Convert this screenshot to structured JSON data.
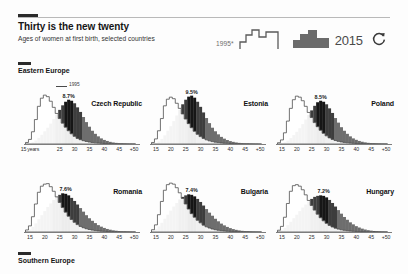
{
  "header": {
    "kicker_mark": "dark-rule",
    "title": "Thirty is the new twenty",
    "subtitle": "Ages of women at first birth, selected countries"
  },
  "legend": {
    "old_year": "1995*",
    "old_icon": "histogram-outline-icon",
    "new_year": "2015",
    "new_icon": "histogram-filled-icon",
    "refresh_icon": "refresh-circular-arrow-icon"
  },
  "regions": {
    "east": "Eastern Europe",
    "south": "Southern Europe"
  },
  "inline_legend": {
    "label": "1995"
  },
  "axis": {
    "ticks": [
      "15 years",
      "25",
      "30",
      "35",
      "40",
      "45",
      "+50"
    ],
    "ticks_short": [
      "15",
      "20",
      "25",
      "30",
      "35",
      "40",
      "45",
      "+50"
    ],
    "tick_positions": [
      15,
      20,
      25,
      30,
      35,
      40,
      45,
      50
    ],
    "xmin": 13,
    "xmax": 52
  },
  "colors": {
    "ink": "#1c1c1c",
    "series_1995": "#ffffff",
    "series_1995_stroke": "#4f4f4f",
    "series_2015": "#6e6e6e",
    "series_2015_peak": "#161616",
    "background": "#fdfdfd"
  },
  "chart_data": {
    "type": "area",
    "title": "Thirty is the new twenty",
    "subtitle": "Ages of women at first birth, selected countries",
    "xlabel": "Age at first birth (years)",
    "ylabel": "Share of first births (%)",
    "xlim": [
      13,
      52
    ],
    "ylim": [
      0,
      11
    ],
    "grid": false,
    "legend": [
      "1995*",
      "2015"
    ],
    "legend_position": "top-right",
    "x": [
      14,
      15,
      16,
      17,
      18,
      19,
      20,
      21,
      22,
      23,
      24,
      25,
      26,
      27,
      28,
      29,
      30,
      31,
      32,
      33,
      34,
      35,
      36,
      37,
      38,
      39,
      40,
      41,
      42,
      43,
      44,
      45,
      46,
      47,
      48,
      49,
      50
    ],
    "panels": [
      {
        "country": "Czech Republic",
        "region": "Eastern Europe",
        "peak_label": "8.7%",
        "peak_age": 28,
        "series": [
          {
            "name": "1995*",
            "peak": 9.6,
            "peak_age": 20,
            "values": [
              0.3,
              0.9,
              2.4,
              4.8,
              7.4,
              9.0,
              9.6,
              9.3,
              8.4,
              7.2,
              6.0,
              5.0,
              4.1,
              3.3,
              2.6,
              2.0,
              1.5,
              1.1,
              0.85,
              0.65,
              0.5,
              0.38,
              0.3,
              0.23,
              0.18,
              0.14,
              0.11,
              0.08,
              0.06,
              0.05,
              0.04,
              0.03,
              0.02,
              0.02,
              0.01,
              0.01,
              0.01
            ]
          },
          {
            "name": "2015",
            "peak": 8.7,
            "peak_age": 28,
            "values": [
              0.05,
              0.15,
              0.35,
              0.7,
              1.2,
              1.8,
              2.5,
              3.2,
              4.0,
              4.9,
              5.8,
              6.7,
              7.6,
              8.3,
              8.7,
              8.5,
              8.0,
              7.2,
              6.3,
              5.3,
              4.3,
              3.4,
              2.6,
              2.0,
              1.5,
              1.1,
              0.8,
              0.6,
              0.42,
              0.3,
              0.22,
              0.16,
              0.11,
              0.08,
              0.05,
              0.04,
              0.03
            ]
          }
        ]
      },
      {
        "country": "Estonia",
        "region": "Eastern Europe",
        "peak_label": "9.5%",
        "peak_age": 27,
        "series": [
          {
            "name": "1995*",
            "peak": 9.2,
            "peak_age": 20,
            "values": [
              0.3,
              1.0,
              2.6,
              5.0,
              7.5,
              8.8,
              9.2,
              8.9,
              8.0,
              7.0,
              5.9,
              4.9,
              4.0,
              3.2,
              2.5,
              1.9,
              1.45,
              1.1,
              0.82,
              0.62,
              0.47,
              0.36,
              0.28,
              0.21,
              0.16,
              0.13,
              0.1,
              0.08,
              0.06,
              0.045,
              0.035,
              0.027,
              0.02,
              0.015,
              0.012,
              0.01,
              0.008
            ]
          },
          {
            "name": "2015",
            "peak": 9.5,
            "peak_age": 27,
            "values": [
              0.06,
              0.2,
              0.5,
              1.0,
              1.7,
              2.6,
              3.5,
              4.5,
              5.6,
              6.7,
              7.8,
              8.7,
              9.3,
              9.5,
              9.1,
              8.3,
              7.3,
              6.2,
              5.1,
              4.1,
              3.2,
              2.5,
              1.9,
              1.4,
              1.05,
              0.78,
              0.57,
              0.42,
              0.3,
              0.22,
              0.16,
              0.12,
              0.09,
              0.06,
              0.045,
              0.03,
              0.025
            ]
          }
        ]
      },
      {
        "country": "Poland",
        "region": "Eastern Europe",
        "peak_label": "8.5%",
        "peak_age": 28,
        "series": [
          {
            "name": "1995*",
            "peak": 9.4,
            "peak_age": 21,
            "values": [
              0.25,
              0.8,
              2.2,
              4.5,
              7.0,
              8.7,
              9.4,
              9.2,
              8.5,
              7.4,
              6.2,
              5.2,
              4.2,
              3.4,
              2.7,
              2.1,
              1.6,
              1.2,
              0.9,
              0.68,
              0.52,
              0.4,
              0.31,
              0.24,
              0.18,
              0.14,
              0.11,
              0.085,
              0.065,
              0.05,
              0.04,
              0.03,
              0.022,
              0.017,
              0.013,
              0.01,
              0.008
            ]
          },
          {
            "name": "2015",
            "peak": 8.5,
            "peak_age": 28,
            "values": [
              0.05,
              0.14,
              0.33,
              0.66,
              1.15,
              1.75,
              2.4,
              3.1,
              3.9,
              4.8,
              5.7,
              6.6,
              7.5,
              8.2,
              8.5,
              8.3,
              7.8,
              7.0,
              6.1,
              5.1,
              4.2,
              3.3,
              2.6,
              2.0,
              1.5,
              1.1,
              0.82,
              0.6,
              0.44,
              0.32,
              0.23,
              0.17,
              0.12,
              0.085,
              0.06,
              0.045,
              0.035
            ]
          }
        ]
      },
      {
        "country": "Romania",
        "region": "Eastern Europe",
        "peak_label": "7.6%",
        "peak_age": 27,
        "series": [
          {
            "name": "1995*",
            "peak": 9.5,
            "peak_age": 21,
            "values": [
              0.4,
              1.2,
              3.0,
              5.5,
              7.8,
              9.0,
              9.4,
              9.5,
              8.9,
              8.0,
              6.9,
              5.8,
              4.8,
              3.9,
              3.1,
              2.45,
              1.9,
              1.45,
              1.1,
              0.84,
              0.64,
              0.49,
              0.37,
              0.28,
              0.22,
              0.17,
              0.13,
              0.1,
              0.075,
              0.057,
              0.044,
              0.034,
              0.026,
              0.02,
              0.015,
              0.012,
              0.009
            ]
          },
          {
            "name": "2015",
            "peak": 7.6,
            "peak_age": 27,
            "values": [
              0.2,
              0.5,
              1.0,
              1.7,
              2.5,
              3.3,
              4.1,
              4.9,
              5.6,
              6.3,
              6.9,
              7.3,
              7.6,
              7.5,
              7.2,
              6.7,
              6.1,
              5.4,
              4.7,
              4.0,
              3.3,
              2.7,
              2.2,
              1.75,
              1.35,
              1.05,
              0.8,
              0.6,
              0.45,
              0.33,
              0.25,
              0.18,
              0.13,
              0.1,
              0.07,
              0.05,
              0.04
            ]
          }
        ]
      },
      {
        "country": "Bulgaria",
        "region": "Eastern Europe",
        "peak_label": "7.4%",
        "peak_age": 27,
        "series": [
          {
            "name": "1995*",
            "peak": 9.6,
            "peak_age": 20,
            "values": [
              0.45,
              1.4,
              3.4,
              6.0,
              8.2,
              9.3,
              9.6,
              9.4,
              8.7,
              7.7,
              6.6,
              5.5,
              4.5,
              3.6,
              2.9,
              2.3,
              1.8,
              1.35,
              1.02,
              0.78,
              0.59,
              0.45,
              0.34,
              0.26,
              0.2,
              0.15,
              0.12,
              0.09,
              0.068,
              0.052,
              0.04,
              0.03,
              0.023,
              0.018,
              0.014,
              0.011,
              0.008
            ]
          },
          {
            "name": "2015",
            "peak": 7.4,
            "peak_age": 27,
            "values": [
              0.25,
              0.6,
              1.1,
              1.8,
              2.6,
              3.4,
              4.2,
              5.0,
              5.7,
              6.4,
              6.9,
              7.2,
              7.4,
              7.3,
              7.0,
              6.5,
              5.9,
              5.2,
              4.5,
              3.8,
              3.2,
              2.6,
              2.1,
              1.65,
              1.3,
              1.0,
              0.76,
              0.57,
              0.42,
              0.31,
              0.23,
              0.17,
              0.12,
              0.09,
              0.065,
              0.047,
              0.035
            ]
          }
        ]
      },
      {
        "country": "Hungary",
        "region": "Eastern Europe",
        "peak_label": "7.2%",
        "peak_age": 29,
        "series": [
          {
            "name": "1995*",
            "peak": 9.3,
            "peak_age": 20,
            "values": [
              0.35,
              1.1,
              2.9,
              5.6,
              8.0,
              9.1,
              9.3,
              9.0,
              8.3,
              7.3,
              6.2,
              5.2,
              4.3,
              3.5,
              2.8,
              2.2,
              1.7,
              1.3,
              0.98,
              0.75,
              0.57,
              0.43,
              0.33,
              0.25,
              0.19,
              0.15,
              0.11,
              0.087,
              0.066,
              0.05,
              0.038,
              0.029,
              0.022,
              0.017,
              0.013,
              0.01,
              0.008
            ]
          },
          {
            "name": "2015",
            "peak": 7.2,
            "peak_age": 29,
            "values": [
              0.15,
              0.4,
              0.8,
              1.35,
              2.0,
              2.7,
              3.4,
              4.1,
              4.8,
              5.4,
              6.0,
              6.5,
              6.9,
              7.1,
              7.2,
              7.1,
              6.8,
              6.3,
              5.7,
              5.0,
              4.3,
              3.6,
              2.95,
              2.4,
              1.9,
              1.5,
              1.15,
              0.88,
              0.66,
              0.49,
              0.36,
              0.27,
              0.2,
              0.14,
              0.1,
              0.075,
              0.055
            ]
          }
        ]
      }
    ]
  }
}
